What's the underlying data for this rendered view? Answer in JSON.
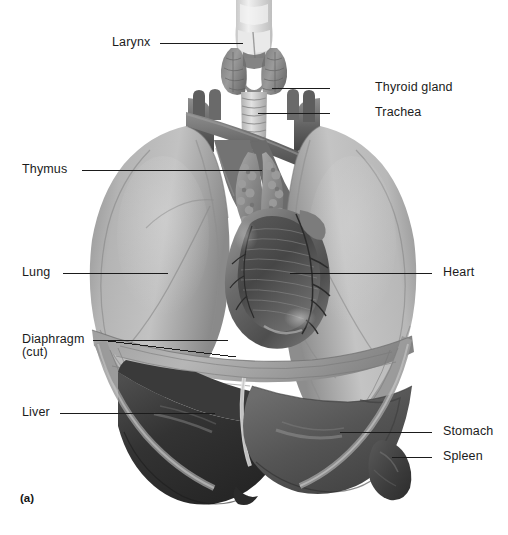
{
  "figure": {
    "panel_letter": "(a)",
    "background_color": "#ffffff",
    "line_color": "#1b1b1b",
    "text_color": "#1b1b1b",
    "width": 508,
    "height": 535
  },
  "labels": [
    {
      "id": "larynx",
      "text": "Larynx",
      "side": "left",
      "text_x": 112,
      "text_y": 36,
      "line": {
        "x1": 160,
        "y1": 43,
        "x2": 243,
        "y2": 43
      }
    },
    {
      "id": "thyroid-gland",
      "text": "Thyroid gland",
      "side": "right",
      "text_x": 375,
      "text_y": 81,
      "line": {
        "x1": 330,
        "y1": 88,
        "x2": 272,
        "y2": 88
      }
    },
    {
      "id": "trachea",
      "text": "Trachea",
      "side": "right",
      "text_x": 375,
      "text_y": 106,
      "line": {
        "x1": 330,
        "y1": 113,
        "x2": 258,
        "y2": 113
      }
    },
    {
      "id": "thymus",
      "text": "Thymus",
      "side": "left",
      "text_x": 22,
      "text_y": 163,
      "line": {
        "x1": 82,
        "y1": 170,
        "x2": 262,
        "y2": 170
      }
    },
    {
      "id": "lung",
      "text": "Lung",
      "side": "left",
      "text_x": 22,
      "text_y": 266,
      "line": {
        "x1": 63,
        "y1": 273,
        "x2": 168,
        "y2": 273
      }
    },
    {
      "id": "heart",
      "text": "Heart",
      "side": "right",
      "text_x": 443,
      "text_y": 266,
      "line": {
        "x1": 432,
        "y1": 273,
        "x2": 290,
        "y2": 273
      }
    },
    {
      "id": "diaphragm-cut",
      "text": "Diaphragm",
      "text_line2": "(cut)",
      "side": "left",
      "text_x": 22,
      "text_y": 333,
      "line": {
        "x1": 93,
        "y1": 340,
        "x2": 228,
        "y2": 340
      },
      "line2": {
        "x1": 93,
        "y1": 340,
        "x2": 232,
        "y2": 355
      }
    },
    {
      "id": "liver",
      "text": "Liver",
      "side": "left",
      "text_x": 22,
      "text_y": 406,
      "line": {
        "x1": 60,
        "y1": 413,
        "x2": 215,
        "y2": 413
      }
    },
    {
      "id": "stomach",
      "text": "Stomach",
      "side": "right",
      "text_x": 443,
      "text_y": 425,
      "line": {
        "x1": 432,
        "y1": 432,
        "x2": 340,
        "y2": 432
      }
    },
    {
      "id": "spleen",
      "text": "Spleen",
      "side": "right",
      "text_x": 443,
      "text_y": 450,
      "line": {
        "x1": 432,
        "y1": 457,
        "x2": 392,
        "y2": 457
      }
    }
  ],
  "anatomy": {
    "description": "Anterior view illustration of the human thoracic and upper abdominal cavity, grayscale medical illustration",
    "structures": [
      {
        "name": "larynx",
        "tone": "#e8e8e8"
      },
      {
        "name": "thyroid-gland",
        "tone": "#8d8d8d"
      },
      {
        "name": "trachea",
        "tone": "#d6d6d6"
      },
      {
        "name": "thymus",
        "tone": "#9a9a9a"
      },
      {
        "name": "left-lung",
        "tone": "#a8a8a8"
      },
      {
        "name": "right-lung",
        "tone": "#a8a8a8"
      },
      {
        "name": "heart",
        "tone": "#6b6b6b"
      },
      {
        "name": "diaphragm",
        "tone": "#7e7e7e"
      },
      {
        "name": "liver",
        "tone": "#3b3b3b"
      },
      {
        "name": "stomach",
        "tone": "#585858"
      },
      {
        "name": "spleen",
        "tone": "#4a4a4a"
      },
      {
        "name": "great-vessels",
        "tone": "#6f6f6f"
      }
    ]
  }
}
